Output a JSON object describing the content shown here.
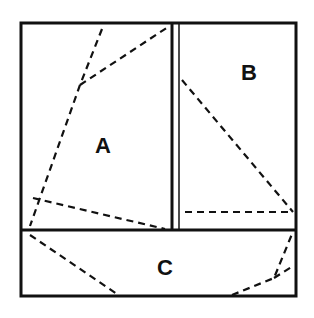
{
  "diagram": {
    "regions": [
      {
        "id": "A",
        "label": "A"
      },
      {
        "id": "B",
        "label": "B"
      },
      {
        "id": "C",
        "label": "C"
      }
    ],
    "colors": {
      "ink": "#111111",
      "background": "#ffffff"
    }
  }
}
